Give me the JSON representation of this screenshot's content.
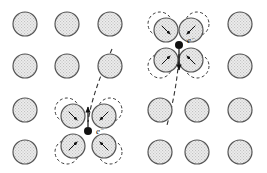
{
  "figure": {
    "title": "",
    "width": 267,
    "height": 173,
    "background_color": "#ffffff"
  },
  "style": {
    "atom_fill": "#e8e8e8",
    "atom_stroke": "#555555",
    "atom_stroke_width": 1.2,
    "ghost_stroke": "#3a3a3a",
    "ghost_dash": "3,2.4",
    "ghost_stroke_width": 1.0,
    "electron_color": "#111111",
    "trajectory_color": "#333333",
    "trajectory_dash": "4.5,3",
    "arrow_color": "#111111"
  },
  "lattice": {
    "name": "atom-lattice",
    "columns": 6,
    "rows": 4,
    "column_x": [
      25,
      67,
      110,
      160,
      197,
      240
    ],
    "row_y": [
      24,
      66,
      110,
      152
    ],
    "atom_radius": 12,
    "displacement_radius": 12
  },
  "atoms": [
    {
      "id": "atom-r1c1",
      "row": 1,
      "col": 1,
      "cx": 25,
      "cy": 24,
      "displaced": false
    },
    {
      "id": "atom-r1c2",
      "row": 1,
      "col": 2,
      "cx": 67,
      "cy": 24,
      "displaced": false
    },
    {
      "id": "atom-r1c3",
      "row": 1,
      "col": 3,
      "cx": 110,
      "cy": 24,
      "displaced": false
    },
    {
      "id": "atom-r1c4",
      "row": 1,
      "col": 4,
      "cx": 160,
      "cy": 24,
      "displaced": true,
      "dx": 6,
      "dy": 6,
      "arrow_angle": 45
    },
    {
      "id": "atom-r1c5",
      "row": 1,
      "col": 5,
      "cx": 197,
      "cy": 24,
      "displaced": true,
      "dx": -6,
      "dy": 6,
      "arrow_angle": 135
    },
    {
      "id": "atom-r1c6",
      "row": 1,
      "col": 6,
      "cx": 240,
      "cy": 24,
      "displaced": false
    },
    {
      "id": "atom-r2c1",
      "row": 2,
      "col": 1,
      "cx": 25,
      "cy": 66,
      "displaced": false
    },
    {
      "id": "atom-r2c2",
      "row": 2,
      "col": 2,
      "cx": 67,
      "cy": 66,
      "displaced": false
    },
    {
      "id": "atom-r2c3",
      "row": 2,
      "col": 3,
      "cx": 110,
      "cy": 66,
      "displaced": false
    },
    {
      "id": "atom-r2c4",
      "row": 2,
      "col": 4,
      "cx": 160,
      "cy": 66,
      "displaced": true,
      "dx": 6,
      "dy": -6,
      "arrow_angle": -45
    },
    {
      "id": "atom-r2c5",
      "row": 2,
      "col": 5,
      "cx": 197,
      "cy": 66,
      "displaced": true,
      "dx": -6,
      "dy": -6,
      "arrow_angle": -135
    },
    {
      "id": "atom-r2c6",
      "row": 2,
      "col": 6,
      "cx": 240,
      "cy": 66,
      "displaced": false
    },
    {
      "id": "atom-r3c1",
      "row": 3,
      "col": 1,
      "cx": 25,
      "cy": 110,
      "displaced": false
    },
    {
      "id": "atom-r3c2",
      "row": 3,
      "col": 2,
      "cx": 67,
      "cy": 110,
      "displaced": true,
      "dx": 6,
      "dy": 6,
      "arrow_angle": 45
    },
    {
      "id": "atom-r3c3",
      "row": 3,
      "col": 3,
      "cx": 110,
      "cy": 110,
      "displaced": true,
      "dx": -6,
      "dy": 6,
      "arrow_angle": 135
    },
    {
      "id": "atom-r3c4",
      "row": 3,
      "col": 4,
      "cx": 160,
      "cy": 110,
      "displaced": false
    },
    {
      "id": "atom-r3c5",
      "row": 3,
      "col": 5,
      "cx": 197,
      "cy": 110,
      "displaced": false
    },
    {
      "id": "atom-r3c6",
      "row": 3,
      "col": 6,
      "cx": 240,
      "cy": 110,
      "displaced": false
    },
    {
      "id": "atom-r4c1",
      "row": 4,
      "col": 1,
      "cx": 25,
      "cy": 152,
      "displaced": false
    },
    {
      "id": "atom-r4c2",
      "row": 4,
      "col": 2,
      "cx": 67,
      "cy": 152,
      "displaced": true,
      "dx": 6,
      "dy": -6,
      "arrow_angle": -45
    },
    {
      "id": "atom-r4c3",
      "row": 4,
      "col": 3,
      "cx": 110,
      "cy": 152,
      "displaced": true,
      "dx": -6,
      "dy": -6,
      "arrow_angle": -135
    },
    {
      "id": "atom-r4c4",
      "row": 4,
      "col": 4,
      "cx": 160,
      "cy": 152,
      "displaced": false
    },
    {
      "id": "atom-r4c5",
      "row": 4,
      "col": 5,
      "cx": 197,
      "cy": 152,
      "displaced": false
    },
    {
      "id": "atom-r4c6",
      "row": 4,
      "col": 6,
      "cx": 240,
      "cy": 152,
      "displaced": false
    }
  ],
  "electrons": [
    {
      "id": "electron-lower-left",
      "label": "e",
      "charge": "−",
      "cx": 88,
      "cy": 131,
      "dot_radius": 4,
      "label_x": 96,
      "label_y": 134,
      "arrow": {
        "x1": 88,
        "y1": 127,
        "x2": 88,
        "y2": 107,
        "direction": "up"
      },
      "trajectory": "M 112,49 C 103,70 92,95 88,122"
    },
    {
      "id": "electron-upper-right",
      "label": "e",
      "charge": "−",
      "cx": 179,
      "cy": 45,
      "dot_radius": 4,
      "label_x": 187,
      "label_y": 43,
      "arrow": {
        "x1": 179,
        "y1": 49,
        "x2": 179,
        "y2": 70,
        "direction": "down"
      },
      "trajectory": "M 179,54 C 178,76 174,100 167,125"
    }
  ],
  "legend": {
    "ghost_meaning": "equilibrium (undisplaced) atom position",
    "solid_meaning": "displaced atom position",
    "dot_meaning": "electron"
  }
}
